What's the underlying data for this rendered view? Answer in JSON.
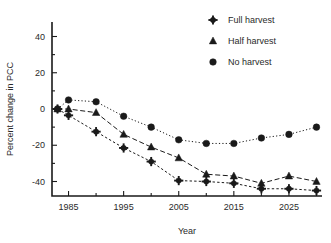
{
  "chart_data": {
    "type": "line",
    "title": "",
    "xlabel": "Year",
    "ylabel": "Percent change in PCC",
    "x": [
      1983,
      1985,
      1990,
      1995,
      2000,
      2005,
      2010,
      2015,
      2020,
      2025,
      2030
    ],
    "xlim": [
      1982,
      2031
    ],
    "ylim": [
      -48,
      48
    ],
    "xticks": [
      1985,
      1995,
      2005,
      2015,
      2025
    ],
    "xtick_labels": [
      "1985",
      "1995",
      "2005",
      "2015",
      "2025"
    ],
    "xticks_minor": [
      1990,
      2000,
      2010,
      2020,
      2030
    ],
    "yticks": [
      40,
      20,
      0,
      -20,
      -40
    ],
    "ytick_labels": [
      "40",
      "20",
      "0",
      "-20",
      "-40"
    ],
    "yticks_minor": [
      30,
      10,
      -10,
      -30
    ],
    "grid": false,
    "legend_position": "upper right",
    "series": [
      {
        "name": "Full harvest",
        "marker": "star-icon",
        "linestyle": "dashdot",
        "color": "#1a1a1a",
        "values": [
          0,
          -3.5,
          -12.5,
          -21.5,
          -29,
          -39.5,
          -40,
          -41,
          -44,
          -44,
          -45
        ]
      },
      {
        "name": "Half harvest",
        "marker": "triangle-icon",
        "linestyle": "dashed",
        "color": "#1a1a1a",
        "values": [
          0,
          0,
          -2,
          -14,
          -21,
          -27,
          -36,
          -37,
          -41,
          -37,
          -40
        ]
      },
      {
        "name": "No harvest",
        "marker": "circle-icon",
        "linestyle": "dotted",
        "color": "#1a1a1a",
        "values": [
          0,
          5,
          4,
          -4,
          -10,
          -17,
          -19,
          -19,
          -16,
          -14,
          -10
        ]
      }
    ]
  },
  "legend": {
    "entries": [
      {
        "label": "Full harvest"
      },
      {
        "label": "Half harvest"
      },
      {
        "label": "No harvest"
      }
    ]
  }
}
